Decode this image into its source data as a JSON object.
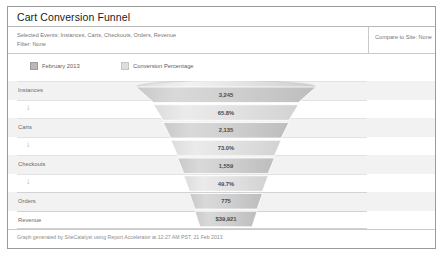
{
  "card": {
    "title": "Cart Conversion Funnel",
    "meta": {
      "selected_events": "Selected Events: Instances, Carts, Checkouts, Orders, Revenue",
      "filter": "Filter: None",
      "compare": "Compare to Site: None"
    },
    "legend": [
      {
        "label": "February 2013",
        "color": "#b9b9b9"
      },
      {
        "label": "Conversion Percentage",
        "color": "#dedede"
      }
    ],
    "footer": "Graph generated by SiteCatalyst using Report Accelerator at 12:27 AM PST, 21 Feb 2013"
  },
  "rows": [
    {
      "label": "Instances",
      "type": "step"
    },
    {
      "label": "",
      "type": "arrow",
      "glyph": "↓"
    },
    {
      "label": "Carts",
      "type": "step"
    },
    {
      "label": "",
      "type": "arrow",
      "glyph": "↓"
    },
    {
      "label": "Checkouts",
      "type": "step"
    },
    {
      "label": "",
      "type": "arrow",
      "glyph": "↓"
    },
    {
      "label": "Orders",
      "type": "step"
    },
    {
      "label": "Revenue",
      "type": "step"
    }
  ],
  "chart_data": {
    "type": "funnel",
    "title": "Cart Conversion Funnel",
    "series_name": "February 2013",
    "percentage_series_name": "Conversion Percentage",
    "stages": [
      {
        "name": "Instances",
        "value": "3,245",
        "kind": "count"
      },
      {
        "name": "Carts to Instances",
        "value": "65.8%",
        "kind": "percentage"
      },
      {
        "name": "Carts",
        "value": "2,135",
        "kind": "count"
      },
      {
        "name": "Checkouts to Carts",
        "value": "73.0%",
        "kind": "percentage"
      },
      {
        "name": "Checkouts",
        "value": "1,559",
        "kind": "count"
      },
      {
        "name": "Orders to Checkouts",
        "value": "49.7%",
        "kind": "percentage"
      },
      {
        "name": "Orders",
        "value": "775",
        "kind": "count"
      },
      {
        "name": "Revenue",
        "value": "$39,921",
        "kind": "currency"
      }
    ],
    "xlabel": "",
    "ylabel": "",
    "grid": true,
    "legend_position": "top"
  }
}
